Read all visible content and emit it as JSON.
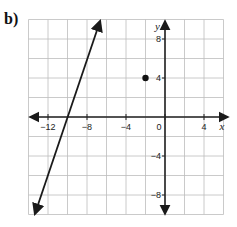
{
  "panel": {
    "label": "b)"
  },
  "chart_data": {
    "type": "line",
    "title": "",
    "xlabel": "x",
    "ylabel": "y",
    "xlim": [
      -14,
      6
    ],
    "ylim": [
      -10,
      10
    ],
    "grid": true,
    "grid_step": 2,
    "x_ticks": [
      -12,
      -8,
      -4,
      0,
      4
    ],
    "x_tick_labels": [
      "−12",
      "−8",
      "−4",
      "0",
      "4"
    ],
    "y_ticks": [
      8,
      4,
      -4,
      -8
    ],
    "y_tick_labels": [
      "8",
      "4",
      "−4",
      "−8"
    ],
    "series": [
      {
        "name": "line",
        "kind": "line",
        "equation": "y = 3x + 30",
        "slope": 3,
        "intercept": 30,
        "x_intercept": -10,
        "arrows_both_ends": true,
        "points": [
          [
            -6.67,
            10
          ],
          [
            -13.33,
            -10
          ]
        ]
      },
      {
        "name": "point",
        "kind": "scatter",
        "points": [
          [
            -2,
            4
          ]
        ]
      }
    ]
  },
  "colors": {
    "grid": "#bdbdbd",
    "axis": "#222222",
    "line": "#1a1a1a",
    "point": "#111111"
  }
}
